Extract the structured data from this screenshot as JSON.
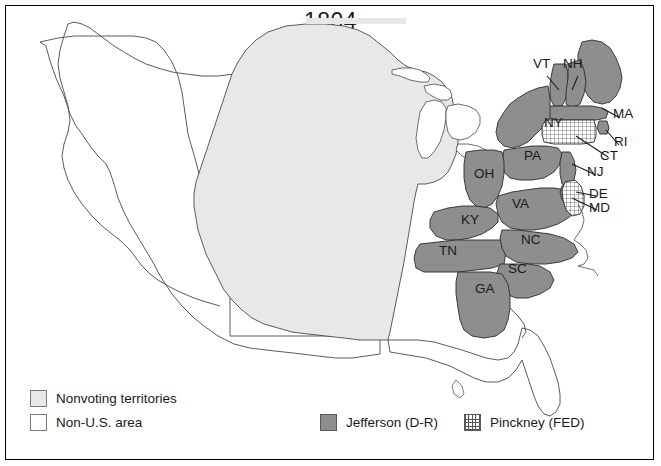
{
  "map": {
    "title": "1804",
    "subject": "United States presidential election electoral map",
    "colors": {
      "jefferson_fill": "#8e8e8e",
      "pinckney_fill": "#ffffff",
      "pinckney_hatch": "#555555",
      "nonvoting_fill": "#e8e8e8",
      "nonus_fill": "#ffffff",
      "outline": "#3a3a3a",
      "border": "#000000",
      "text": "#1a1a1a"
    },
    "state_labels": [
      {
        "code": "VT",
        "x": 545,
        "y": 64,
        "leader": true
      },
      {
        "code": "NH",
        "x": 575,
        "y": 64,
        "leader": true
      },
      {
        "code": "MA",
        "x": 621,
        "y": 114,
        "leader": true
      },
      {
        "code": "RI",
        "x": 620,
        "y": 143,
        "leader": true
      },
      {
        "code": "CT",
        "x": 607,
        "y": 157,
        "leader": true
      },
      {
        "code": "NJ",
        "x": 595,
        "y": 172,
        "leader": true
      },
      {
        "code": "DE",
        "x": 597,
        "y": 194,
        "leader": true
      },
      {
        "code": "MD",
        "x": 598,
        "y": 208,
        "leader": true
      },
      {
        "code": "NY",
        "x": 553,
        "y": 124,
        "leader": false
      },
      {
        "code": "PA",
        "x": 533,
        "y": 157,
        "leader": false
      },
      {
        "code": "OH",
        "x": 483,
        "y": 175,
        "leader": false
      },
      {
        "code": "VA",
        "x": 521,
        "y": 205,
        "leader": false
      },
      {
        "code": "KY",
        "x": 470,
        "y": 221,
        "leader": false
      },
      {
        "code": "TN",
        "x": 448,
        "y": 252,
        "leader": false
      },
      {
        "code": "NC",
        "x": 530,
        "y": 241,
        "leader": false
      },
      {
        "code": "SC",
        "x": 517,
        "y": 270,
        "leader": false
      },
      {
        "code": "GA",
        "x": 484,
        "y": 290,
        "leader": false
      }
    ],
    "jefferson_states": [
      "VT",
      "NH",
      "MA",
      "RI",
      "NY",
      "PA",
      "NJ",
      "OH",
      "VA",
      "KY",
      "TN",
      "NC",
      "SC",
      "GA",
      "MD"
    ],
    "pinckney_states": [
      "CT",
      "DE"
    ]
  },
  "legend": {
    "left": [
      {
        "label": "Nonvoting territories",
        "swatch": "nonvoting-swatch"
      },
      {
        "label": "Non-U.S. area",
        "swatch": "nonus-swatch"
      }
    ],
    "bottom_right": [
      {
        "label": "Jefferson (D-R)",
        "swatch": "jefferson-swatch"
      },
      {
        "label": "Pinckney (FED)",
        "swatch": "pinckney-swatch"
      }
    ]
  }
}
